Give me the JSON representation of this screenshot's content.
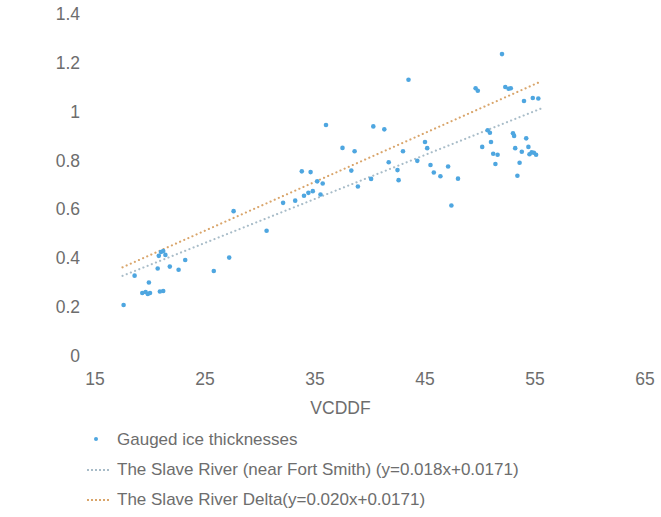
{
  "chart_data": {
    "type": "scatter",
    "title": "",
    "xlabel": "VCDDF",
    "ylabel": "Ice thicknesses(m)",
    "xlim": [
      15,
      65
    ],
    "ylim": [
      0,
      1.4
    ],
    "xticks": [
      15,
      25,
      35,
      45,
      55,
      65
    ],
    "yticks": [
      "0",
      "0.2",
      "0.4",
      "0.6",
      "0.8",
      "1",
      "1.2",
      "1.4"
    ],
    "ytick_values": [
      0,
      0.2,
      0.4,
      0.6,
      0.8,
      1.0,
      1.2,
      1.4
    ],
    "grid": false,
    "legend_position": "below-left",
    "colors": {
      "points": "#4ea6e0",
      "fit_fort_smith": "#a8bcc8",
      "fit_delta": "#d9a56b",
      "text": "#6d6d6d",
      "background": "#ffffff"
    },
    "series": [
      {
        "name": "Gauged ice thicknesses",
        "type": "scatter",
        "marker": "dot",
        "color": "#4ea6e0",
        "points": [
          [
            17.6,
            0.213
          ],
          [
            18.6,
            0.333
          ],
          [
            19.3,
            0.262
          ],
          [
            19.6,
            0.266
          ],
          [
            19.8,
            0.258
          ],
          [
            20.0,
            0.262
          ],
          [
            20.9,
            0.268
          ],
          [
            21.2,
            0.27
          ],
          [
            19.9,
            0.305
          ],
          [
            20.7,
            0.362
          ],
          [
            20.8,
            0.414
          ],
          [
            21.0,
            0.43
          ],
          [
            21.2,
            0.434
          ],
          [
            21.4,
            0.418
          ],
          [
            21.8,
            0.37
          ],
          [
            22.6,
            0.357
          ],
          [
            23.2,
            0.397
          ],
          [
            25.8,
            0.352
          ],
          [
            27.2,
            0.407
          ],
          [
            27.6,
            0.597
          ],
          [
            30.6,
            0.517
          ],
          [
            32.1,
            0.631
          ],
          [
            33.2,
            0.64
          ],
          [
            34.0,
            0.66
          ],
          [
            34.4,
            0.672
          ],
          [
            34.8,
            0.679
          ],
          [
            35.5,
            0.665
          ],
          [
            35.2,
            0.719
          ],
          [
            35.7,
            0.71
          ],
          [
            33.8,
            0.76
          ],
          [
            34.6,
            0.757
          ],
          [
            36.0,
            0.95
          ],
          [
            37.5,
            0.856
          ],
          [
            38.6,
            0.842
          ],
          [
            38.3,
            0.763
          ],
          [
            38.9,
            0.698
          ],
          [
            40.1,
            0.729
          ],
          [
            40.3,
            0.944
          ],
          [
            41.3,
            0.932
          ],
          [
            41.7,
            0.797
          ],
          [
            42.5,
            0.765
          ],
          [
            42.6,
            0.724
          ],
          [
            43.0,
            0.842
          ],
          [
            43.5,
            1.135
          ],
          [
            44.3,
            0.803
          ],
          [
            45.0,
            0.88
          ],
          [
            45.2,
            0.855
          ],
          [
            45.5,
            0.786
          ],
          [
            45.8,
            0.755
          ],
          [
            46.4,
            0.74
          ],
          [
            47.1,
            0.78
          ],
          [
            47.4,
            0.62
          ],
          [
            48.0,
            0.73
          ],
          [
            49.6,
            1.1
          ],
          [
            49.8,
            1.09
          ],
          [
            50.2,
            0.86
          ],
          [
            50.7,
            0.928
          ],
          [
            50.9,
            0.918
          ],
          [
            51.0,
            0.88
          ],
          [
            51.2,
            0.832
          ],
          [
            51.4,
            0.79
          ],
          [
            51.6,
            0.828
          ],
          [
            52.0,
            1.24
          ],
          [
            52.3,
            1.105
          ],
          [
            52.6,
            1.098
          ],
          [
            52.8,
            1.1
          ],
          [
            53.0,
            0.916
          ],
          [
            53.1,
            0.905
          ],
          [
            53.2,
            0.855
          ],
          [
            53.4,
            0.742
          ],
          [
            53.6,
            0.795
          ],
          [
            53.8,
            0.84
          ],
          [
            54.0,
            1.048
          ],
          [
            54.2,
            0.895
          ],
          [
            54.4,
            0.86
          ],
          [
            54.5,
            0.83
          ],
          [
            54.7,
            0.838
          ],
          [
            54.9,
            0.836
          ],
          [
            55.1,
            0.828
          ],
          [
            55.3,
            1.058
          ],
          [
            54.8,
            1.06
          ]
        ]
      },
      {
        "name": "The Slave River (near Fort Smith) (y=0.018x+0.0171)",
        "type": "line",
        "style": "dotted",
        "color": "#a8bcc8",
        "slope": 0.018,
        "intercept": 0.0171,
        "x_start": 17.5,
        "x_end": 55.5
      },
      {
        "name": "The Slave River Delta(y=0.020x+0.0171)",
        "type": "line",
        "style": "dotted",
        "color": "#d9a56b",
        "slope": 0.02,
        "intercept": 0.0171,
        "x_start": 17.5,
        "x_end": 55.5
      }
    ]
  },
  "legend": {
    "items": [
      {
        "label": "Gauged ice thicknesses",
        "key": "dot",
        "color": "#4ea6e0"
      },
      {
        "label": "The Slave River (near Fort Smith) (y=0.018x+0.0171)",
        "key": "dotted-line",
        "color": "#a8bcc8"
      },
      {
        "label": "The Slave River Delta(y=0.020x+0.0171)",
        "key": "dotted-line",
        "color": "#d9a56b"
      }
    ]
  }
}
